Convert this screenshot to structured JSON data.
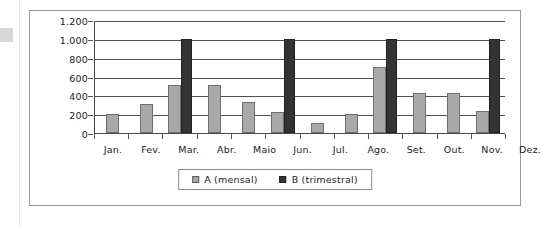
{
  "chart_data": {
    "type": "bar",
    "title": "",
    "xlabel": "",
    "ylabel": "",
    "ylim": [
      0,
      1200
    ],
    "ytick_labels": [
      "1.200",
      "1.000",
      "800",
      "600",
      "400",
      "200",
      "0"
    ],
    "ytick_values": [
      1200,
      1000,
      800,
      600,
      400,
      200,
      0
    ],
    "grid": true,
    "legend_position": "bottom-center",
    "categories": [
      "Jan.",
      "Fev.",
      "Mar.",
      "Abr.",
      "Maio",
      "Jun.",
      "Jul.",
      "Ago.",
      "Set.",
      "Out.",
      "Nov.",
      "Dez."
    ],
    "series": [
      {
        "name": "A (mensal)",
        "color": "#a9a9a9",
        "values": [
          200,
          310,
          510,
          510,
          330,
          220,
          110,
          200,
          700,
          430,
          430,
          230
        ]
      },
      {
        "name": "B (trimestral)",
        "color": "#333333",
        "values": [
          null,
          null,
          1000,
          null,
          null,
          1000,
          null,
          null,
          1000,
          null,
          null,
          1000
        ]
      }
    ]
  },
  "legend": {
    "entries": [
      {
        "label": "A (mensal)",
        "swatch": "swatch-a"
      },
      {
        "label": "B (trimestral)",
        "swatch": "swatch-b"
      }
    ]
  }
}
